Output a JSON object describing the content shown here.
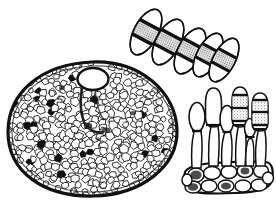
{
  "figure": {
    "subtitle": "Pycnidium with ostiole, conidial chain, and conidiophore layer",
    "medium": "ink line drawing",
    "background_color": "#ffffff",
    "ink_color": "#111111",
    "shade_color": "#8d8d8d",
    "width": 276,
    "height": 212,
    "caption": "",
    "labels": []
  },
  "panels": [
    {
      "id": "conidial-chain",
      "name": "conidial-chain",
      "description": "Chain of five overlapping septate conidia arranged diagonally from upper-left to lower-right",
      "count": 5,
      "orientation_degrees": 28,
      "bbox": {
        "x": 118,
        "y": 6,
        "width": 118,
        "height": 78
      }
    },
    {
      "id": "pycnidium",
      "name": "pycnidium-section",
      "description": "Large oval fruiting body in section, filled with pseudoparenchymatous cells, with an ostiole opening at the upper right and a darker central cavity",
      "bbox": {
        "x": 8,
        "y": 62,
        "width": 170,
        "height": 134
      },
      "ostiole": {
        "cx": 93,
        "cy": 79,
        "rx": 14,
        "ry": 10
      },
      "cell_count": 520
    },
    {
      "id": "conidiophore-layer",
      "name": "conidiophore-layer",
      "description": "Six club-shaped conidiophores with developing septate conidia rising from a basal stroma of polygonal cells",
      "conidiophore_count": 6,
      "basal_cell_count": 12,
      "bbox": {
        "x": 182,
        "y": 86,
        "width": 92,
        "height": 108
      }
    }
  ],
  "conidia": [
    {
      "index": 1,
      "cx": 146,
      "cy": 32,
      "rx": 25,
      "ry": 12,
      "angle": 118,
      "septa": 2,
      "shaded_cells": [
        1
      ]
    },
    {
      "index": 2,
      "cx": 168,
      "cy": 42,
      "rx": 25,
      "ry": 12,
      "angle": 118,
      "septa": 2,
      "shaded_cells": [
        1
      ]
    },
    {
      "index": 3,
      "cx": 190,
      "cy": 51,
      "rx": 25,
      "ry": 12,
      "angle": 118,
      "septa": 2,
      "shaded_cells": [
        1
      ]
    },
    {
      "index": 4,
      "cx": 208,
      "cy": 55,
      "rx": 24,
      "ry": 11,
      "angle": 118,
      "septa": 2,
      "shaded_cells": [
        1
      ]
    },
    {
      "index": 5,
      "cx": 224,
      "cy": 60,
      "rx": 24,
      "ry": 11,
      "angle": 118,
      "septa": 2,
      "shaded_cells": [
        1
      ]
    }
  ],
  "conidiophores": [
    {
      "index": 1,
      "base_x": 196,
      "head_cy": 117,
      "head_rx": 8,
      "head_ry": 14,
      "height": 62,
      "septa": 0,
      "shaded": false
    },
    {
      "index": 2,
      "base_x": 213,
      "head_cy": 106,
      "head_rx": 8.5,
      "head_ry": 18,
      "height": 72,
      "septa": 0,
      "shaded": false
    },
    {
      "index": 3,
      "base_x": 226,
      "head_cy": 119,
      "head_rx": 7,
      "head_ry": 13,
      "height": 58,
      "septa": 0,
      "shaded": false
    },
    {
      "index": 4,
      "base_x": 240,
      "head_cy": 105,
      "head_rx": 8,
      "head_ry": 17,
      "height": 73,
      "septa": 2,
      "shaded": true
    },
    {
      "index": 5,
      "base_x": 249,
      "head_cy": 127,
      "head_rx": 5.5,
      "head_ry": 9,
      "height": 44,
      "septa": 1,
      "shaded": false
    },
    {
      "index": 6,
      "base_x": 260,
      "head_cy": 110,
      "head_rx": 8,
      "head_ry": 16,
      "height": 66,
      "septa": 2,
      "shaded": true
    }
  ]
}
